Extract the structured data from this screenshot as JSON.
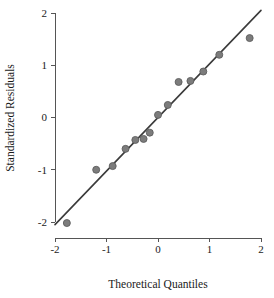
{
  "chart_data": {
    "type": "scatter",
    "title": "",
    "subtitle": "",
    "xlabel": "Theoretical Quantiles",
    "ylabel": "Standardized Residuals",
    "xlim": [
      -2,
      2
    ],
    "ylim": [
      -2,
      2
    ],
    "xticks": [
      -2,
      -1,
      0,
      1,
      2
    ],
    "yticks": [
      -2,
      -1,
      0,
      1,
      2
    ],
    "xtick_labels": [
      "-2",
      "-1",
      "0",
      "1",
      "2"
    ],
    "ytick_labels": [
      "-2",
      "-1",
      "0",
      "1",
      "2"
    ],
    "grid": false,
    "legend": null,
    "legend_position": "none",
    "point_color": "#7c7c7c",
    "point_edge_color": "#5e5e5e",
    "line_color": "#3b3b3b",
    "axis_color": "#555555",
    "marker": "circle",
    "marker_size": 7,
    "series": [
      {
        "name": "Standardized residuals",
        "x": [
          -1.77,
          -1.2,
          -0.88,
          -0.63,
          -0.44,
          -0.28,
          -0.16,
          0.0,
          0.19,
          0.4,
          0.63,
          0.88,
          1.19,
          1.78
        ],
        "y": [
          -2.02,
          -1.0,
          -0.93,
          -0.6,
          -0.43,
          -0.41,
          -0.29,
          0.05,
          0.24,
          0.68,
          0.7,
          0.88,
          1.2,
          1.52
        ]
      }
    ],
    "reference_line": {
      "name": "qq-reference-line",
      "x": [
        -2,
        2
      ],
      "y": [
        -2.05,
        2.05
      ]
    }
  },
  "figure": {
    "plot_area": {
      "x_left_px": 55,
      "x_right_px": 261,
      "y_top_px": 13,
      "y_bottom_px": 222
    }
  }
}
